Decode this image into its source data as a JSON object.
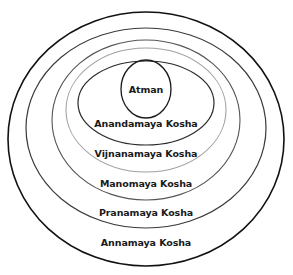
{
  "diagram": {
    "core": {
      "label": "Atman"
    },
    "layers": [
      {
        "label": "Anandamaya Kosha",
        "stroke": "#2a2a2a"
      },
      {
        "label": "Vijnanamaya Kosha",
        "stroke": "#9a9a9a"
      },
      {
        "label": "Manomaya Kosha",
        "stroke": "#5a5a5a"
      },
      {
        "label": "Pranamaya Kosha",
        "stroke": "#3a3a3a"
      },
      {
        "label": "Annamaya Kosha",
        "stroke": "#111111"
      }
    ]
  }
}
